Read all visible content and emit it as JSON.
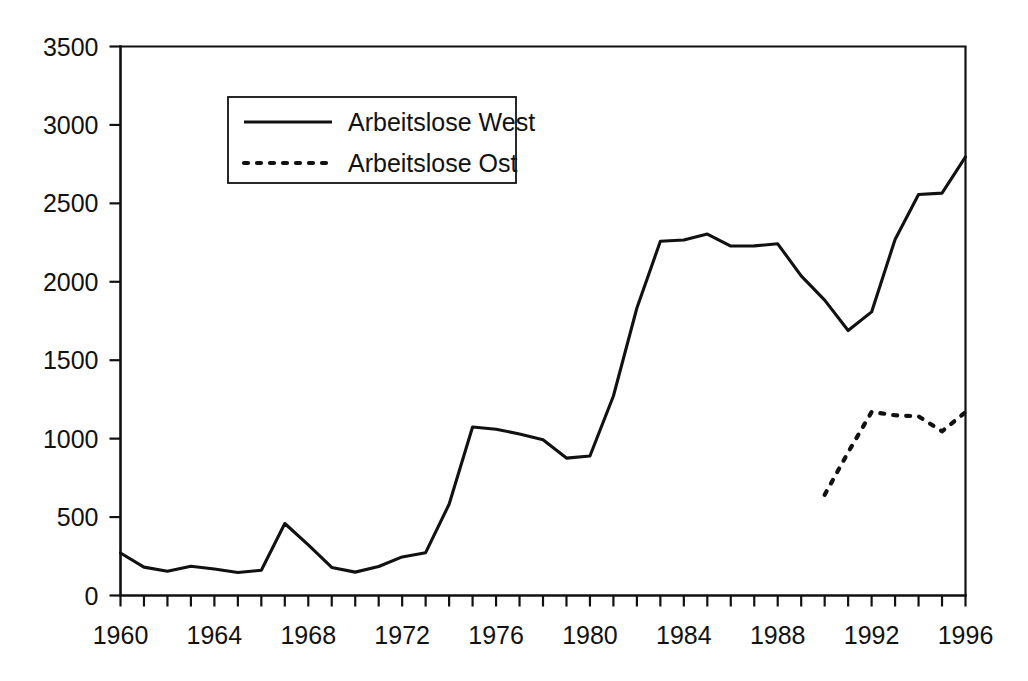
{
  "chart_data": {
    "type": "line",
    "title": "",
    "subtitle": "",
    "xlabel": "",
    "ylabel": "",
    "xlim": [
      1960,
      1996
    ],
    "ylim": [
      0,
      3500
    ],
    "grid": false,
    "legend_position": "top-left-inside",
    "x_tick_labels": [
      "1960",
      "1964",
      "1968",
      "1972",
      "1976",
      "1980",
      "1984",
      "1988",
      "1992",
      "1996"
    ],
    "x_tick_label_values": [
      1960,
      1964,
      1968,
      1972,
      1976,
      1980,
      1984,
      1988,
      1992,
      1996
    ],
    "x_minor_ticks_every": 1,
    "y_tick_labels": [
      "0",
      "500",
      "1000",
      "1500",
      "2000",
      "2500",
      "3000",
      "3500"
    ],
    "y_tick_values": [
      0,
      500,
      1000,
      1500,
      2000,
      2500,
      3000,
      3500
    ],
    "x": [
      1960,
      1961,
      1962,
      1963,
      1964,
      1965,
      1966,
      1967,
      1968,
      1969,
      1970,
      1971,
      1972,
      1973,
      1974,
      1975,
      1976,
      1977,
      1978,
      1979,
      1980,
      1981,
      1982,
      1983,
      1984,
      1985,
      1986,
      1987,
      1988,
      1989,
      1990,
      1991,
      1992,
      1993,
      1994,
      1995,
      1996
    ],
    "series": [
      {
        "name": "Arbeitslose West",
        "style": "solid",
        "color": "#111111",
        "x": [
          1960,
          1961,
          1962,
          1963,
          1964,
          1965,
          1966,
          1967,
          1968,
          1969,
          1970,
          1971,
          1972,
          1973,
          1974,
          1975,
          1976,
          1977,
          1978,
          1979,
          1980,
          1981,
          1982,
          1983,
          1984,
          1985,
          1986,
          1987,
          1988,
          1989,
          1990,
          1991,
          1992,
          1993,
          1994,
          1995,
          1996
        ],
        "values": [
          271,
          181,
          155,
          186,
          169,
          147,
          161,
          459,
          323,
          179,
          149,
          185,
          246,
          273,
          582,
          1074,
          1060,
          1030,
          993,
          876,
          889,
          1272,
          1833,
          2258,
          2266,
          2304,
          2228,
          2229,
          2242,
          2038,
          1883,
          1689,
          1808,
          2270,
          2556,
          2565,
          2796
        ]
      },
      {
        "name": "Arbeitslose Ost",
        "style": "dotted",
        "color": "#111111",
        "x": [
          1990,
          1991,
          1992,
          1993,
          1994,
          1995,
          1996
        ],
        "values": [
          642,
          913,
          1170,
          1149,
          1142,
          1047,
          1169
        ]
      }
    ]
  },
  "legend": {
    "entries": [
      {
        "label": "Arbeitslose West",
        "style": "solid"
      },
      {
        "label": "Arbeitslose Ost",
        "style": "dotted"
      }
    ]
  }
}
